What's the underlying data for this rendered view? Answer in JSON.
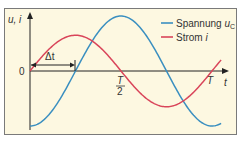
{
  "chart_data": {
    "type": "line",
    "title": "",
    "xlabel": "t",
    "ylabel": "u, i",
    "x_unit": "period T",
    "xlim": [
      0,
      1.1
    ],
    "ylim": [
      -1,
      1
    ],
    "x_ticks": [
      {
        "value": 0.5,
        "label_num": "T",
        "label_den": "2"
      },
      {
        "value": 1.0,
        "label": "T"
      }
    ],
    "origin_label": "0",
    "annotation": {
      "label": "Δt",
      "from": 0,
      "to": 0.25
    },
    "series": [
      {
        "name": "Spannung u_C",
        "legend_main": "Spannung ",
        "legend_var": "u",
        "legend_sub": "C",
        "color": "#3a8fc0",
        "function": "-cos(2πt/T)",
        "amplitude": 1.0,
        "phase_shift": 0.25
      },
      {
        "name": "Strom i",
        "legend_main": "Strom ",
        "legend_var": "i",
        "color": "#d9455a",
        "function": "sin(2πt/T)",
        "amplitude": 0.65,
        "phase_shift": 0
      }
    ],
    "legend_position": "top-right",
    "grid": false,
    "background": "#fdf8e1",
    "frame_color": "#7a7a7a"
  }
}
